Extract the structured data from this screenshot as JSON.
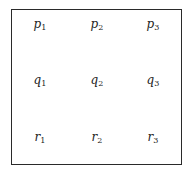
{
  "grid": {
    "rows": [
      {
        "name": "p",
        "cells": [
          {
            "var": "p",
            "sub": "1"
          },
          {
            "var": "p",
            "sub": "2"
          },
          {
            "var": "p",
            "sub": "3"
          }
        ]
      },
      {
        "name": "q",
        "cells": [
          {
            "var": "q",
            "sub": "1"
          },
          {
            "var": "q",
            "sub": "2"
          },
          {
            "var": "q",
            "sub": "3"
          }
        ]
      },
      {
        "name": "r",
        "cells": [
          {
            "var": "r",
            "sub": "1"
          },
          {
            "var": "r",
            "sub": "2"
          },
          {
            "var": "r",
            "sub": "3"
          }
        ]
      }
    ]
  }
}
